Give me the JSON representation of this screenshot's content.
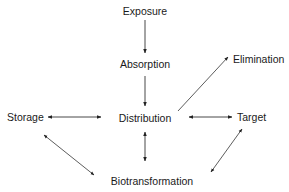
{
  "diagram": {
    "nodes": {
      "exposure": {
        "label": "Exposure"
      },
      "absorption": {
        "label": "Absorption"
      },
      "distribution": {
        "label": "Distribution"
      },
      "elimination": {
        "label": "Elimination"
      },
      "storage": {
        "label": "Storage"
      },
      "target": {
        "label": "Target"
      },
      "biotransformation": {
        "label": "Biotransformation"
      }
    },
    "edges": [
      {
        "from": "Exposure",
        "to": "Absorption",
        "direction": "one-way"
      },
      {
        "from": "Absorption",
        "to": "Distribution",
        "direction": "one-way"
      },
      {
        "from": "Distribution",
        "to": "Elimination",
        "direction": "one-way"
      },
      {
        "from": "Storage",
        "to": "Distribution",
        "direction": "two-way"
      },
      {
        "from": "Distribution",
        "to": "Target",
        "direction": "two-way"
      },
      {
        "from": "Distribution",
        "to": "Biotransformation",
        "direction": "two-way"
      },
      {
        "from": "Storage",
        "to": "Biotransformation",
        "direction": "two-way"
      },
      {
        "from": "Target",
        "to": "Biotransformation",
        "direction": "two-way"
      }
    ],
    "colors": {
      "line": "#333333",
      "text": "#1a1a1a",
      "background": "#ffffff"
    }
  }
}
